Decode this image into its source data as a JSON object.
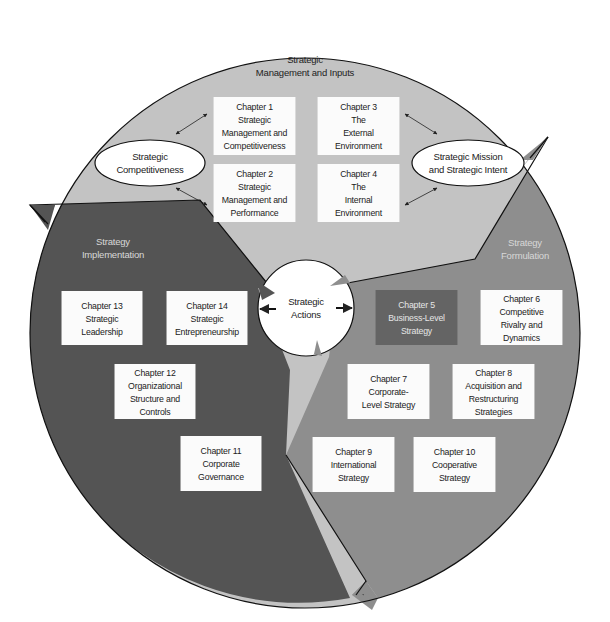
{
  "colors": {
    "background": "#ffffff",
    "inputs_segment": "#c3c3c3",
    "formulation_segment": "#8e8e8e",
    "implementation_segment": "#545454",
    "box_fill": "#fbfbfb",
    "highlight_box_fill": "#646464",
    "outline": "#111111"
  },
  "segments": {
    "inputs": {
      "title_lines": [
        "Strategic",
        "Management and Inputs"
      ]
    },
    "formulation": {
      "title_lines": [
        "Strategy",
        "Formulation"
      ]
    },
    "implementation": {
      "title_lines": [
        "Strategy",
        "Implementation"
      ]
    }
  },
  "ovals": {
    "left": {
      "lines": [
        "Strategic",
        "Competitiveness"
      ]
    },
    "right": {
      "lines": [
        "Strategic Mission",
        "and Strategic Intent"
      ]
    }
  },
  "center": {
    "lines": [
      "Strategic",
      "Actions"
    ]
  },
  "chapters": [
    {
      "id": "ch1",
      "lines": [
        "Chapter 1",
        "Strategic",
        "Management and",
        "Competitiveness"
      ]
    },
    {
      "id": "ch2",
      "lines": [
        "Chapter 2",
        "Strategic",
        "Management and",
        "Performance"
      ]
    },
    {
      "id": "ch3",
      "lines": [
        "Chapter 3",
        "The",
        "External",
        "Environment"
      ]
    },
    {
      "id": "ch4",
      "lines": [
        "Chapter 4",
        "The",
        "Internal",
        "Environment"
      ]
    },
    {
      "id": "ch5",
      "lines": [
        "Chapter 5",
        "Business-Level",
        "Strategy"
      ],
      "highlighted": true
    },
    {
      "id": "ch6",
      "lines": [
        "Chapter 6",
        "Competitive",
        "Rivalry and",
        "Dynamics"
      ]
    },
    {
      "id": "ch7",
      "lines": [
        "Chapter 7",
        "Corporate-",
        "Level Strategy"
      ]
    },
    {
      "id": "ch8",
      "lines": [
        "Chapter 8",
        "Acquisition and",
        "Restructuring",
        "Strategies"
      ]
    },
    {
      "id": "ch9",
      "lines": [
        "Chapter 9",
        "International",
        "Strategy"
      ]
    },
    {
      "id": "ch10",
      "lines": [
        "Chapter 10",
        "Cooperative",
        "Strategy"
      ]
    },
    {
      "id": "ch11",
      "lines": [
        "Chapter 11",
        "Corporate",
        "Governance"
      ]
    },
    {
      "id": "ch12",
      "lines": [
        "Chapter 12",
        "Organizational",
        "Structure and",
        "Controls"
      ]
    },
    {
      "id": "ch13",
      "lines": [
        "Chapter 13",
        "Strategic",
        "Leadership"
      ]
    },
    {
      "id": "ch14",
      "lines": [
        "Chapter 14",
        "Strategic",
        "Entrepreneurship"
      ]
    }
  ]
}
